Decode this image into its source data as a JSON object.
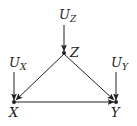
{
  "diagram": {
    "type": "causal-graph",
    "nodes": [
      {
        "id": "UZ",
        "label": "U",
        "subscript": "Z",
        "kind": "exogenous"
      },
      {
        "id": "Z",
        "label": "Z",
        "kind": "endogenous"
      },
      {
        "id": "UX",
        "label": "U",
        "subscript": "X",
        "kind": "exogenous"
      },
      {
        "id": "UY",
        "label": "U",
        "subscript": "Y",
        "kind": "exogenous"
      },
      {
        "id": "X",
        "label": "X",
        "kind": "endogenous"
      },
      {
        "id": "Y",
        "label": "Y",
        "kind": "endogenous"
      }
    ],
    "edges": [
      {
        "from": "UZ",
        "to": "Z"
      },
      {
        "from": "UX",
        "to": "X"
      },
      {
        "from": "UY",
        "to": "Y"
      },
      {
        "from": "Z",
        "to": "X"
      },
      {
        "from": "Z",
        "to": "Y"
      },
      {
        "from": "X",
        "to": "Y"
      }
    ],
    "labels": {
      "uz_main": "U",
      "uz_sub": "Z",
      "z": "Z",
      "ux_main": "U",
      "ux_sub": "X",
      "uy_main": "U",
      "uy_sub": "Y",
      "x": "X",
      "y": "Y"
    },
    "colors": {
      "line": "#222222",
      "background": "#ffffff"
    }
  }
}
